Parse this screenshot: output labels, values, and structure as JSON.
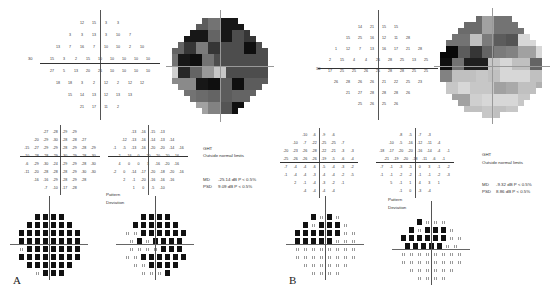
{
  "panels": [
    {
      "label": "A",
      "threshold_axis_label_left": "30",
      "threshold_values": [
        [
          "12",
          "15",
          "3",
          "3"
        ],
        [
          "3",
          "3",
          "13",
          "3",
          "10",
          "7"
        ],
        [
          "13",
          "7",
          "16",
          "7",
          "10",
          "10",
          "2",
          "10"
        ],
        [
          "15",
          "3",
          "2",
          "15",
          "10",
          "10",
          "10",
          "10",
          "10"
        ],
        [
          "27",
          "5",
          "13",
          "20",
          "26",
          "10",
          "10",
          "10",
          "10"
        ],
        [
          "18",
          "18",
          "3",
          "2",
          "12",
          "2",
          "12",
          "12"
        ],
        [
          "15",
          "14",
          "13",
          "12",
          "13",
          "13"
        ],
        [
          "21",
          "17",
          "11",
          "2"
        ]
      ],
      "total_deviation": [
        [
          "-27",
          "-28",
          "-29",
          "-29"
        ],
        [
          "-20",
          "-29",
          "-30",
          "-28",
          "-28",
          "-27"
        ],
        [
          "-15",
          "-27",
          "-29",
          "-29",
          "-28",
          "-29",
          "-28",
          "-29"
        ],
        [
          "-10",
          "-28",
          "-28",
          "-29",
          "-30",
          "-29",
          "-28",
          "-30"
        ],
        [
          "-6",
          "-29",
          "-30",
          "-24",
          "-29",
          "-29",
          "-28",
          "-30"
        ],
        [
          "-11",
          "-20",
          "-28",
          "-28",
          "-28",
          "-29",
          "-30",
          "-30"
        ],
        [
          "-16",
          "-16",
          "-29",
          "-28",
          "-29",
          "-28"
        ],
        [
          "-7",
          "-10",
          "-17",
          "-28"
        ]
      ],
      "pattern_deviation_values": [
        [
          "-13",
          "-16",
          "-15",
          "-13"
        ],
        [
          "-12",
          "-13",
          "-16",
          "-14",
          "-13",
          "-14"
        ],
        [
          "-1",
          "-5",
          "-13",
          "-16",
          "-20",
          "-20",
          "-14",
          "-16"
        ],
        [
          "2",
          "-16",
          "0",
          "-20",
          "-20",
          "-20",
          "-16"
        ],
        [
          "4",
          "0",
          "0",
          "3",
          "-16",
          "-20",
          "-16"
        ],
        [
          "-2",
          "0",
          "-14",
          "-17",
          "-20",
          "-18",
          "-20",
          "-16"
        ],
        [
          "2",
          "-1",
          "-20",
          "-16",
          "-16",
          "-16"
        ],
        [
          "1",
          "0",
          "-5",
          "-10"
        ]
      ],
      "ght_label": "GHT",
      "ght_value": "Outside normal limits",
      "md_label": "MD",
      "md_value": "-25.14 dB  P < 0.5%",
      "psd_label": "PSD",
      "psd_value": "9.09 dB  P < 0.5%",
      "pattern_deviation_title_1": "Pattern",
      "pattern_deviation_title_2": "Deviation"
    },
    {
      "label": "B",
      "threshold_axis_label_left": "30",
      "threshold_values": [
        [
          "14",
          "21",
          "15",
          "15"
        ],
        [
          "15",
          "25",
          "16",
          "12",
          "11",
          "28"
        ],
        [
          "1",
          "12",
          "7",
          "13",
          "16",
          "17",
          "21",
          "28"
        ],
        [
          "2",
          "15",
          "4",
          "4",
          "26",
          "28",
          "25",
          "13",
          "25"
        ],
        [
          "17",
          "25",
          "25",
          "26",
          "25",
          "28",
          "28",
          "25",
          "25"
        ],
        [
          "26",
          "28",
          "26",
          "26",
          "21",
          "22",
          "25",
          "23"
        ],
        [
          "21",
          "27",
          "28",
          "28",
          "28",
          "26"
        ],
        [
          "25",
          "26",
          "25",
          "26"
        ]
      ],
      "total_deviation": [
        [
          "-10",
          "-6",
          "-9",
          "-6"
        ],
        [
          "-10",
          "-7",
          "-22",
          "-25",
          "-25",
          "-7"
        ],
        [
          "-20",
          "-23",
          "-26",
          "-28",
          "-22",
          "-21",
          "-3",
          "-3"
        ],
        [
          "-25",
          "-26",
          "-26",
          "-26",
          "-19",
          "-5",
          "-6",
          "-4"
        ],
        [
          "-7",
          "-4",
          "-4",
          "-6",
          "-5",
          "-4",
          "-3",
          "-2"
        ],
        [
          "-1",
          "-4",
          "-4",
          "-3",
          "-4",
          "-4",
          "-2",
          "-5"
        ],
        [
          "2",
          "-1",
          "-4",
          "-3",
          "-2",
          "-1"
        ],
        [
          "-4",
          "-4",
          "-4",
          "-4"
        ]
      ],
      "pattern_deviation_values": [
        [
          "-8",
          "-5",
          "-7",
          "-3"
        ],
        [
          "-10",
          "-5",
          "-16",
          "-12",
          "-11",
          "-4"
        ],
        [
          "-18",
          "-17",
          "-20",
          "-20",
          "-16",
          "-14",
          "-4",
          "-1"
        ],
        [
          "-21",
          "-19",
          "-20",
          "-18",
          "-11",
          "-6",
          "-1"
        ],
        [
          "-7",
          "-1",
          "-3",
          "-5",
          "0",
          "3",
          "-1",
          "-2"
        ],
        [
          "-1",
          "-1",
          "-2",
          "-2",
          "-1",
          "-1",
          "-2",
          "-3"
        ],
        [
          "5",
          "-1",
          "1",
          "4",
          "3",
          "1"
        ],
        [
          "-1",
          "0",
          "-3",
          "-4"
        ]
      ],
      "ght_label": "GHT",
      "ght_value": "Outside normal limits",
      "md_label": "MD",
      "md_value": "-9.32 dB  P < 0.5%",
      "psd_label": "PSD",
      "psd_value": "8.86 dB  P < 0.5%",
      "pattern_deviation_title_1": "Pattern",
      "pattern_deviation_title_2": "Deviation"
    }
  ],
  "colors": {
    "ink": "#111111",
    "line": "#444444",
    "paper": "#ffffff"
  }
}
